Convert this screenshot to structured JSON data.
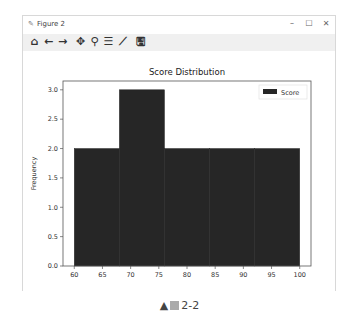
{
  "window": {
    "title": "Figure 2",
    "controls": {
      "minimize": "–",
      "maximize": "☐",
      "close": "✕"
    }
  },
  "toolbar": {
    "tools": [
      {
        "name": "home",
        "glyph": "⌂"
      },
      {
        "name": "back",
        "glyph": "←"
      },
      {
        "name": "forward",
        "glyph": "→"
      },
      {
        "name": "pan",
        "glyph": "✥"
      },
      {
        "name": "zoom",
        "glyph": "⚲"
      },
      {
        "name": "configure-subplots",
        "glyph": "☰"
      },
      {
        "name": "edit-axis",
        "glyph": "⟋"
      },
      {
        "name": "save",
        "glyph": "🖫"
      }
    ]
  },
  "caption": {
    "prefix": "▲",
    "label": "2-2"
  },
  "colors": {
    "bar": "#262626",
    "axis": "#555555",
    "text": "#333333"
  },
  "chart_data": {
    "type": "bar",
    "title": "Score Distribution",
    "xlabel": "",
    "ylabel": "Frequency",
    "bins": [
      [
        60,
        68
      ],
      [
        68,
        76
      ],
      [
        76,
        84
      ],
      [
        84,
        92
      ],
      [
        92,
        100
      ]
    ],
    "categories": [
      "60-68",
      "68-76",
      "76-84",
      "84-92",
      "92-100"
    ],
    "values": [
      2,
      3,
      2,
      2,
      2
    ],
    "xlim": [
      58,
      102
    ],
    "ylim": [
      0,
      3.15
    ],
    "xticks": [
      60,
      65,
      70,
      75,
      80,
      85,
      90,
      95,
      100
    ],
    "yticks": [
      "0.0",
      "0.5",
      "1.0",
      "1.5",
      "2.0",
      "2.5",
      "3.0"
    ],
    "legend": {
      "entries": [
        "Score"
      ],
      "position": "upper right"
    },
    "grid": false
  }
}
